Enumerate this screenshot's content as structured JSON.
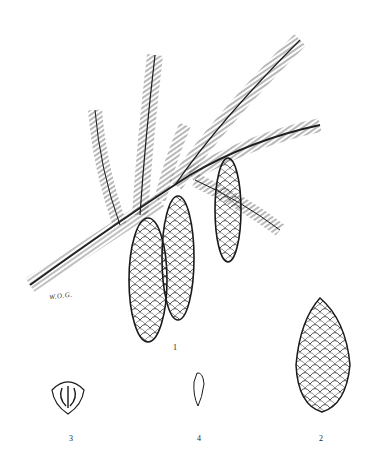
{
  "figure": {
    "labels": {
      "branch": "1",
      "cone_detached": "2",
      "scale": "3",
      "seed": "4"
    },
    "signature": "W.O.G."
  },
  "colors": {
    "ink": "#1a1a1a",
    "paper": "#ffffff",
    "shade": "#777777"
  }
}
